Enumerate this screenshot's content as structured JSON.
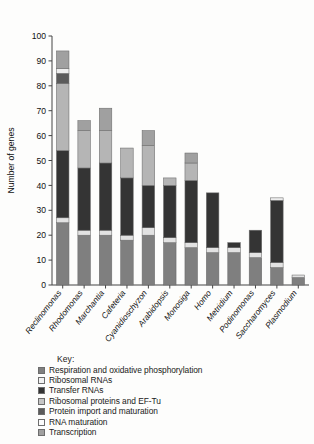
{
  "chart_data": {
    "type": "bar",
    "stacked": true,
    "title": "",
    "xlabel": "",
    "ylabel": "Number of genes",
    "ylim": [
      0,
      100
    ],
    "yticks": [
      0,
      10,
      20,
      30,
      40,
      50,
      60,
      70,
      80,
      90,
      100
    ],
    "grid": false,
    "legend_position": "below",
    "legend_title": "Key:",
    "categories": [
      "Reclinomonas",
      "Rhodomonas",
      "Marchantia",
      "Cafeteria",
      "Cyanidioschyzon",
      "Arabidopsis",
      "Monosiga",
      "Homo",
      "Metridium",
      "Podinomonas",
      "Saccharomyces",
      "Plasmodium"
    ],
    "series": [
      {
        "name": "Respiration and oxidative phosphorylation",
        "color": "#7f7f7f",
        "values": [
          25,
          20,
          20,
          18,
          20,
          17,
          15,
          13,
          13,
          11,
          7,
          3
        ]
      },
      {
        "name": "Ribosomal RNAs",
        "color": "#e2e2e2",
        "values": [
          2,
          2,
          2,
          2,
          3,
          2,
          2,
          2,
          2,
          2,
          2,
          1
        ]
      },
      {
        "name": "Transfer RNAs",
        "color": "#343434",
        "values": [
          27,
          25,
          27,
          23,
          17,
          21,
          25,
          22,
          2,
          9,
          25,
          0
        ]
      },
      {
        "name": "Ribosomal proteins and EF-Tu",
        "color": "#b5b5b5",
        "values": [
          27,
          15,
          13,
          12,
          16,
          3,
          7,
          0,
          0,
          0,
          0,
          0
        ]
      },
      {
        "name": "Protein import and maturation",
        "color": "#5b5b5b",
        "values": [
          4,
          0,
          0,
          0,
          0,
          0,
          0,
          0,
          0,
          0,
          0,
          0
        ]
      },
      {
        "name": "RNA maturation",
        "color": "#ededed",
        "values": [
          2,
          0,
          0,
          0,
          0,
          0,
          0,
          0,
          0,
          0,
          1,
          0
        ]
      },
      {
        "name": "Transcription",
        "color": "#a0a0a0",
        "values": [
          7,
          4,
          9,
          0,
          6,
          0,
          4,
          0,
          0,
          0,
          0,
          0
        ]
      }
    ],
    "totals": [
      94,
      66,
      71,
      55,
      62,
      43,
      53,
      37,
      17,
      22,
      35,
      4
    ]
  },
  "legend": {
    "title": "Key:",
    "items": [
      {
        "label": "Respiration and oxidative phosphorylation",
        "color": "#7f7f7f"
      },
      {
        "label": "Ribosomal RNAs",
        "color": "#f2f2f2"
      },
      {
        "label": "Transfer RNAs",
        "color": "#343434"
      },
      {
        "label": "Ribosomal proteins and EF-Tu",
        "color": "#c6c6c6"
      },
      {
        "label": "Protein import and maturation",
        "color": "#5b5b5b"
      },
      {
        "label": "RNA maturation",
        "color": "#fbfbfb"
      },
      {
        "label": "Transcription",
        "color": "#a0a0a0"
      }
    ]
  }
}
